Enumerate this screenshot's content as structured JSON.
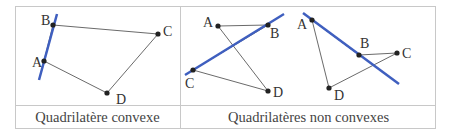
{
  "captions": {
    "convex": "Quadrilatère convexe",
    "non_convex": "Quadrilatères non convexes"
  },
  "figures": {
    "convex": {
      "labels": {
        "A": "A",
        "B": "B",
        "C": "C",
        "D": "D"
      }
    },
    "non_convex_1": {
      "labels": {
        "A": "A",
        "B": "B",
        "C": "C",
        "D": "D"
      }
    },
    "non_convex_2": {
      "labels": {
        "A": "A",
        "B": "B",
        "C": "C",
        "D": "D"
      }
    }
  },
  "colors": {
    "line": "#3f5fbf",
    "edge": "#333333",
    "border": "#c8c8c8"
  }
}
